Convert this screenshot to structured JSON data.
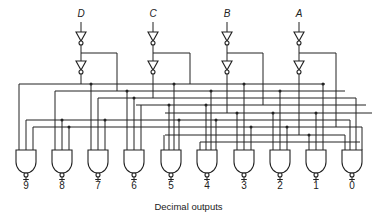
{
  "inputs": [
    "D",
    "C",
    "B",
    "A"
  ],
  "outputs": [
    "9",
    "8",
    "7",
    "6",
    "5",
    "4",
    "3",
    "2",
    "1",
    "0"
  ],
  "caption": "Decimal outputs",
  "colors": {
    "line": "#222222",
    "background": "#ffffff"
  }
}
